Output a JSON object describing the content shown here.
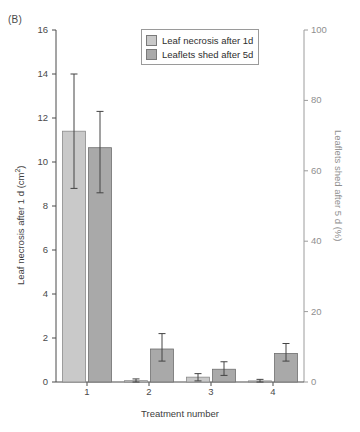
{
  "panel": {
    "label": "(B)"
  },
  "chart_data": {
    "type": "bar",
    "title": "",
    "panel_label": "(B)",
    "xlabel": "Treatment number",
    "categories": [
      "1",
      "2",
      "3",
      "4"
    ],
    "xtick_labels": [
      "1",
      "2",
      "3",
      "4"
    ],
    "grid": false,
    "legend_position": "top-center",
    "left_axis": {
      "label": "Leaf necrosis after 1 d (cm²)",
      "label_plain": "Leaf necrosis after 1 d (cm2)",
      "ylim": [
        0,
        16
      ],
      "ticks": [
        0,
        2,
        4,
        6,
        8,
        10,
        12,
        14,
        16
      ],
      "tick_labels": [
        "0",
        "2",
        "4",
        "6",
        "8",
        "10",
        "12",
        "14",
        "16"
      ],
      "color": "#3d3d3d"
    },
    "right_axis": {
      "label": "Leaflets shed after 5 d (%)",
      "ylim": [
        0,
        100
      ],
      "ticks": [
        0,
        20,
        40,
        60,
        80,
        100
      ],
      "tick_labels": [
        "0",
        "20",
        "40",
        "60",
        "80",
        "100"
      ],
      "color": "#8f8f8f"
    },
    "series": [
      {
        "name": "Leaf necrosis after 1d",
        "axis": "left",
        "color": "#c9c9c9",
        "edge_color": "#8a8a8a",
        "values": [
          11.4,
          0.06,
          0.22,
          0.05
        ],
        "err_low": [
          8.8,
          0.0,
          0.05,
          0.0
        ],
        "err_high": [
          14.0,
          0.14,
          0.38,
          0.12
        ]
      },
      {
        "name": "Leaflets shed after 5d",
        "axis": "right",
        "color": "#a9a9a9",
        "edge_color": "#6f6f6f",
        "values_left_scale": [
          10.65,
          1.5,
          0.58,
          1.3
        ],
        "values_percent": [
          66.6,
          9.4,
          3.6,
          8.1
        ],
        "err_low_left_scale": [
          8.6,
          0.95,
          0.3,
          0.95
        ],
        "err_high_left_scale": [
          12.3,
          2.2,
          0.92,
          1.75
        ]
      }
    ]
  },
  "legend": {
    "items": [
      {
        "label": "Leaf necrosis after 1d",
        "color": "#c9c9c9"
      },
      {
        "label": "Leaflets shed after 5d",
        "color": "#a9a9a9"
      }
    ]
  }
}
